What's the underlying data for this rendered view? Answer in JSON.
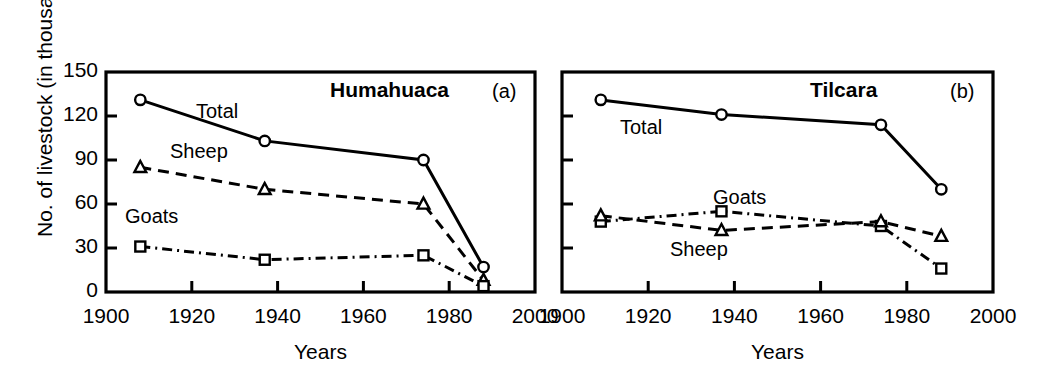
{
  "figure": {
    "y_axis_title": "No. of livestock (in thousands)",
    "x_axis_title": "Years",
    "y_ticks": [
      "0",
      "30",
      "60",
      "90",
      "120",
      "150"
    ],
    "x_ticks": [
      "1900",
      "1920",
      "1940",
      "1960",
      "1980",
      "2000"
    ],
    "panels": [
      {
        "tag": "(a)",
        "title": "Humahuaca",
        "series_labels": [
          "Total",
          "Sheep",
          "Goats"
        ]
      },
      {
        "tag": "(b)",
        "title": "Tilcara",
        "series_labels": [
          "Total",
          "Goats",
          "Sheep"
        ]
      }
    ]
  },
  "chart_data": [
    {
      "type": "line",
      "title": "Humahuaca",
      "panel_tag": "(a)",
      "xlabel": "Years",
      "ylabel": "No. of livestock (in thousands)",
      "xlim": [
        1900,
        2000
      ],
      "ylim": [
        0,
        150
      ],
      "xticks": [
        1900,
        1920,
        1940,
        1960,
        1980,
        2000
      ],
      "yticks": [
        0,
        30,
        60,
        90,
        120,
        150
      ],
      "grid": false,
      "legend": "inline-labels",
      "x": [
        1908,
        1937,
        1974,
        1988
      ],
      "series": [
        {
          "name": "Total",
          "marker": "circle",
          "linestyle": "solid",
          "values": [
            131,
            103,
            90,
            17
          ]
        },
        {
          "name": "Sheep",
          "marker": "triangle",
          "linestyle": "dashed",
          "values": [
            85,
            70,
            60,
            8
          ]
        },
        {
          "name": "Goats",
          "marker": "square",
          "linestyle": "dash-dot",
          "values": [
            31,
            22,
            25,
            4
          ]
        }
      ]
    },
    {
      "type": "line",
      "title": "Tilcara",
      "panel_tag": "(b)",
      "xlabel": "Years",
      "ylabel": "No. of livestock (in thousands)",
      "xlim": [
        1900,
        2000
      ],
      "ylim": [
        0,
        150
      ],
      "xticks": [
        1900,
        1920,
        1940,
        1960,
        1980,
        2000
      ],
      "yticks": [
        0,
        30,
        60,
        90,
        120,
        150
      ],
      "grid": false,
      "legend": "inline-labels",
      "x": [
        1909,
        1937,
        1974,
        1988
      ],
      "series": [
        {
          "name": "Total",
          "marker": "circle",
          "linestyle": "solid",
          "values": [
            131,
            121,
            114,
            70
          ]
        },
        {
          "name": "Goats",
          "marker": "square",
          "linestyle": "dash-dot",
          "values": [
            48,
            55,
            45,
            16
          ]
        },
        {
          "name": "Sheep",
          "marker": "triangle",
          "linestyle": "dashed",
          "values": [
            52,
            42,
            48,
            38
          ]
        }
      ]
    }
  ],
  "colors": {
    "ink": "#000000",
    "background": "#ffffff"
  }
}
